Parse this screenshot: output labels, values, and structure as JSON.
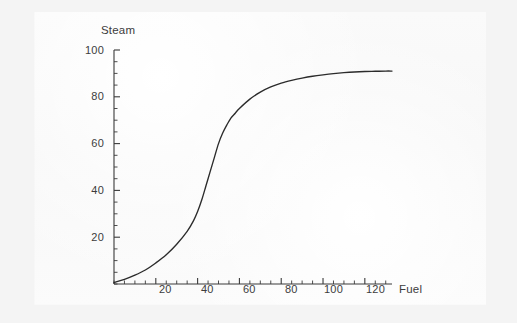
{
  "figure": {
    "background_color": "#f4f4f4",
    "panel_color": "#fafafa",
    "line_color": "#2b2b2b",
    "axis_color": "#3a3a3a",
    "text_color": "#3c3c3c"
  },
  "chart_data": {
    "type": "line",
    "title": "",
    "xlabel": "Fuel",
    "ylabel": "Steam",
    "xlim": [
      0,
      133
    ],
    "ylim": [
      0,
      100
    ],
    "grid": false,
    "legend": null,
    "x_ticks": [
      20,
      40,
      60,
      80,
      100,
      120
    ],
    "x_tick_labels": [
      "20",
      "40",
      "60",
      "80",
      "100",
      "120"
    ],
    "x_minor_tick_step": 5,
    "y_ticks": [
      20,
      40,
      60,
      80,
      100
    ],
    "y_tick_labels": [
      "20",
      "40",
      "60",
      "80",
      "100"
    ],
    "y_minor_tick_step": 5,
    "series": [
      {
        "name": "steam-vs-fuel",
        "x": [
          0,
          5,
          10,
          15,
          20,
          25,
          30,
          35,
          38,
          40,
          42,
          44,
          46,
          48,
          50,
          52,
          54,
          56,
          58,
          60,
          65,
          70,
          75,
          80,
          85,
          90,
          95,
          100,
          105,
          110,
          115,
          120,
          125,
          130,
          133
        ],
        "y": [
          0.6,
          2.0,
          3.8,
          6.0,
          9.0,
          12.5,
          17.0,
          22.5,
          27.0,
          31.0,
          36.0,
          42.0,
          48.0,
          54.0,
          60.0,
          64.5,
          68.0,
          71.0,
          73.0,
          75.0,
          79.0,
          82.0,
          84.2,
          85.8,
          87.0,
          88.0,
          88.8,
          89.4,
          89.9,
          90.3,
          90.6,
          90.8,
          90.9,
          91.0,
          91.0
        ]
      }
    ]
  }
}
